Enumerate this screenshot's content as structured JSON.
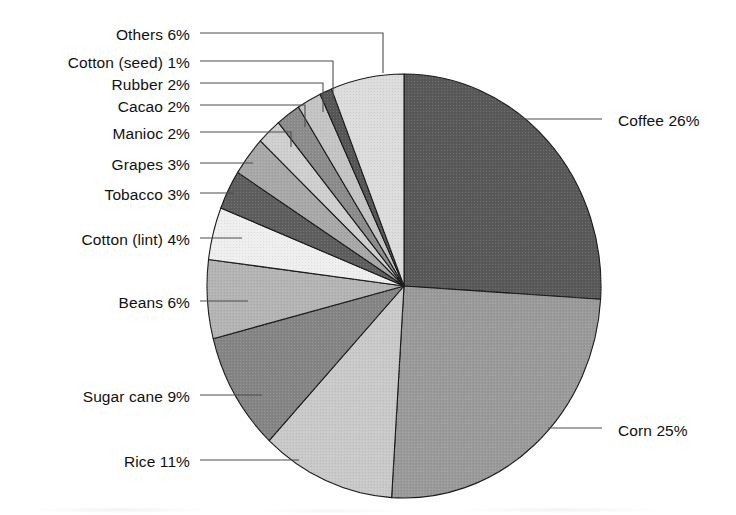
{
  "chart_data": {
    "type": "pie",
    "title": "",
    "subtitle": "",
    "xlabel": "",
    "ylabel": "",
    "legend_position": "callout-labels",
    "grid": false,
    "units": "percent",
    "total": 100,
    "start_angle_deg": 0,
    "direction": "clockwise",
    "categories": [
      "Coffee",
      "Corn",
      "Rice",
      "Sugar cane",
      "Beans",
      "Cotton (lint)",
      "Tobacco",
      "Grapes",
      "Manioc",
      "Cacao",
      "Rubber",
      "Cotton (seed)",
      "Others"
    ],
    "values": [
      26,
      25,
      11,
      9,
      6,
      4,
      3,
      3,
      2,
      2,
      2,
      1,
      6
    ],
    "labels": [
      "Coffee 26%",
      "Corn 25%",
      "Rice 11%",
      "Sugar cane 9%",
      "Beans 6%",
      "Cotton (lint) 4%",
      "Tobacco 3%",
      "Grapes 3%",
      "Manioc 2%",
      "Cacao 2%",
      "Rubber 2%",
      "Cotton (seed) 1%",
      "Others 6%"
    ],
    "colors": [
      "#595959",
      "#9a9a9a",
      "#c9c9c9",
      "#858585",
      "#b4b4b4",
      "#efefef",
      "#5e5e5e",
      "#a8a8a8",
      "#cfcfcf",
      "#8c8c8c",
      "#c4c4c4",
      "#565656",
      "#dcdcdc"
    ],
    "slices": [
      {
        "name": "Coffee",
        "label": "Coffee 26%",
        "value": 26,
        "color": "#595959",
        "side": "right",
        "label_x": 618,
        "label_y": 113,
        "leader": "M 512 119 L 602 119"
      },
      {
        "name": "Corn",
        "label": "Corn 25%",
        "value": 25,
        "color": "#9a9a9a",
        "side": "right",
        "label_x": 618,
        "label_y": 423,
        "leader": "M 548 428 L 602 428"
      },
      {
        "name": "Rice",
        "label": "Rice 11%",
        "value": 11,
        "color": "#c9c9c9",
        "side": "left",
        "label_x": 190,
        "label_y": 454,
        "leader": "M 200 460 L 299 460"
      },
      {
        "name": "Sugar cane",
        "label": "Sugar cane 9%",
        "value": 9,
        "color": "#858585",
        "side": "left",
        "label_x": 190,
        "label_y": 389,
        "leader": "M 200 395 L 262 395"
      },
      {
        "name": "Beans",
        "label": "Beans 6%",
        "value": 6,
        "color": "#b4b4b4",
        "side": "left",
        "label_x": 190,
        "label_y": 295,
        "leader": "M 200 301 L 248 301"
      },
      {
        "name": "Cotton (lint)",
        "label": "Cotton (lint) 4%",
        "value": 4,
        "color": "#efefef",
        "side": "left",
        "label_x": 190,
        "label_y": 232,
        "leader": "M 200 238 L 242 238"
      },
      {
        "name": "Tobacco",
        "label": "Tobacco 3%",
        "value": 3,
        "color": "#5e5e5e",
        "side": "left",
        "label_x": 190,
        "label_y": 187,
        "leader": "M 200 193 L 234 193"
      },
      {
        "name": "Grapes",
        "label": "Grapes 3%",
        "value": 3,
        "color": "#a8a8a8",
        "side": "left",
        "label_x": 190,
        "label_y": 157,
        "leader": "M 200 163 L 253 163"
      },
      {
        "name": "Manioc",
        "label": "Manioc 2%",
        "value": 2,
        "color": "#cfcfcf",
        "side": "left",
        "label_x": 190,
        "label_y": 126,
        "leader": "M 200 132 L 291 132 L 291 147"
      },
      {
        "name": "Cacao",
        "label": "Cacao 2%",
        "value": 2,
        "color": "#8c8c8c",
        "side": "left",
        "label_x": 190,
        "label_y": 99,
        "leader": "M 200 105 L 305 105 L 305 127"
      },
      {
        "name": "Rubber",
        "label": "Rubber 2%",
        "value": 2,
        "color": "#c4c4c4",
        "side": "left",
        "label_x": 190,
        "label_y": 77,
        "leader": "M 200 83 L 323 83 L 323 112"
      },
      {
        "name": "Cotton (seed)",
        "label": "Cotton (seed) 1%",
        "value": 1,
        "color": "#565656",
        "side": "left",
        "label_x": 190,
        "label_y": 55,
        "leader": "M 200 61 L 333 61 L 333 100"
      },
      {
        "name": "Others",
        "label": "Others 6%",
        "value": 6,
        "color": "#dcdcdc",
        "side": "left",
        "label_x": 190,
        "label_y": 27,
        "leader": "M 200 33 L 383 33 L 383 73"
      }
    ],
    "geometry": {
      "center_x": 404,
      "center_y": 286,
      "radius_x": 197,
      "radius_y": 212
    }
  }
}
